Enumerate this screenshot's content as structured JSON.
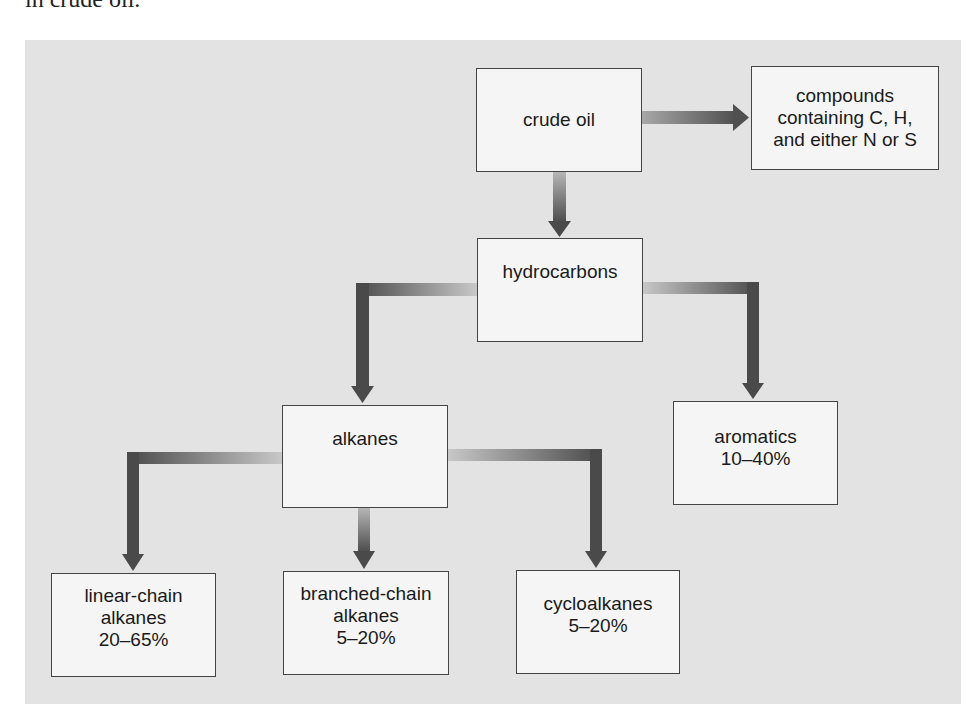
{
  "caption": "in crude oil.",
  "colors": {
    "panel_bg": "#e3e3e3",
    "node_fill": "#f5f5f5",
    "node_border": "#444444",
    "arrow_light": "#c4c4c4",
    "arrow_dark": "#4a4a4a"
  },
  "nodes": {
    "crude_oil": {
      "lines": [
        "crude oil"
      ]
    },
    "compounds": {
      "lines": [
        "compounds",
        "containing C, H,",
        "and either N or S"
      ]
    },
    "hydrocarbons": {
      "lines": [
        "hydrocarbons"
      ]
    },
    "alkanes": {
      "lines": [
        "alkanes"
      ]
    },
    "aromatics": {
      "lines": [
        "aromatics",
        "10–40%"
      ]
    },
    "linear": {
      "lines": [
        "linear-chain",
        "alkanes",
        "20–65%"
      ]
    },
    "branched": {
      "lines": [
        "branched-chain",
        "alkanes",
        "5–20%"
      ]
    },
    "cycloalkanes": {
      "lines": [
        "cycloalkanes",
        "5–20%"
      ]
    }
  },
  "edges": [
    {
      "from": "crude oil",
      "to": "compounds containing C, H, and either N or S"
    },
    {
      "from": "crude oil",
      "to": "hydrocarbons"
    },
    {
      "from": "hydrocarbons",
      "to": "alkanes"
    },
    {
      "from": "hydrocarbons",
      "to": "aromatics"
    },
    {
      "from": "alkanes",
      "to": "linear-chain alkanes"
    },
    {
      "from": "alkanes",
      "to": "branched-chain alkanes"
    },
    {
      "from": "alkanes",
      "to": "cycloalkanes"
    }
  ]
}
